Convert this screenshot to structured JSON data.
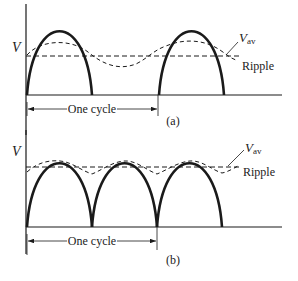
{
  "figure": {
    "colors": {
      "ink": "#1a1a1a",
      "background": "#ffffff"
    },
    "panels": [
      {
        "id": "a",
        "caption": "(a)",
        "y_label": "V",
        "avg_label_main": "V",
        "avg_label_sub": "av",
        "ripple_label": "Ripple",
        "cycle_label": "One cycle",
        "rectifier": "half-wave",
        "pulses_per_cycle": 1,
        "cycles_shown": 2
      },
      {
        "id": "b",
        "caption": "(b)",
        "y_label": "V",
        "avg_label_main": "V",
        "avg_label_sub": "av",
        "ripple_label": "Ripple",
        "cycle_label": "One cycle",
        "rectifier": "full-wave",
        "pulses_per_cycle": 2,
        "cycles_shown": 1.5
      }
    ]
  }
}
